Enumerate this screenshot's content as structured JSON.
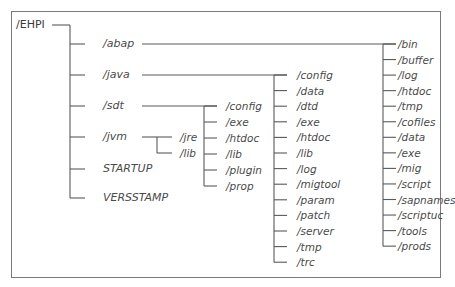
{
  "diagram": {
    "root": {
      "label": "/EHPI",
      "x": 16,
      "y": 25
    },
    "level1_trunk_x": 70,
    "level1_label_x": 103,
    "level1": [
      {
        "id": "abap",
        "label": "/abap",
        "y": 44
      },
      {
        "id": "java",
        "label": "/java",
        "y": 75
      },
      {
        "id": "sdt",
        "label": "/sdt",
        "y": 106
      },
      {
        "id": "jvm",
        "label": "/jvm",
        "y": 137
      },
      {
        "id": "startup",
        "label": "STARTUP",
        "y": 169
      },
      {
        "id": "versstamp",
        "label": "VERSSTAMP",
        "y": 198
      }
    ],
    "abap_children": {
      "trunk_x": 383,
      "label_x": 398,
      "items": [
        "/bin",
        "/buffer",
        "/log",
        "/htdoc",
        "/tmp",
        "/cofiles",
        "/data",
        "/exe",
        "/mig",
        "/script",
        "/sapnames",
        "/scriptuc",
        "/tools",
        "/prods"
      ]
    },
    "java_children": {
      "trunk_x": 274,
      "label_x": 297,
      "items": [
        "/config",
        "/data",
        "/dtd",
        "/exe",
        "/htdoc",
        "/lib",
        "/log",
        "/migtool",
        "/param",
        "/patch",
        "/server",
        "/tmp",
        "/trc"
      ]
    },
    "sdt_children": {
      "trunk_x": 204,
      "label_x": 226,
      "items": [
        "/config",
        "/exe",
        "/htdoc",
        "/lib",
        "/plugin",
        "/prop"
      ]
    },
    "jvm_children": {
      "trunk_x": 157,
      "label_x": 180,
      "items": [
        "/jre",
        "/lib"
      ]
    },
    "line_color": "#5a5a5a",
    "text_color": "#4a4a4a",
    "frame_color": "#7a7a7a"
  }
}
